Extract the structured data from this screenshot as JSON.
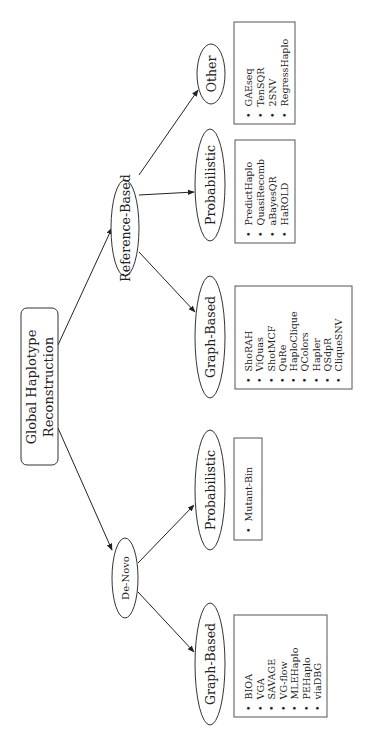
{
  "diagram": {
    "orientation": "rotated-90-ccw",
    "root": {
      "label_line1": "Global Haplotype",
      "label_line2": "Reconstruction"
    },
    "branches": [
      {
        "label": "Reference-Based",
        "children": [
          {
            "label": "Graph-Based",
            "items": [
              "ShoRAH",
              "ViQuas",
              "ShotMCF",
              "QuRe",
              "HaploClique",
              "QColors",
              "Hapler",
              "QSdpR",
              "CliqueSNV"
            ]
          },
          {
            "label": "Probabilistic",
            "items": [
              "PredictHaplo",
              "QuasiRecomb",
              "aBayesQR",
              "HaROLD"
            ]
          },
          {
            "label": "Other",
            "items": [
              "GAEseq",
              "TenSQR",
              "2SNV",
              "RegressHaplo"
            ]
          }
        ]
      },
      {
        "label": "De-Novo",
        "children": [
          {
            "label": "Graph-Based",
            "items": [
              "BIOA",
              "VGA",
              "SAVAGE",
              "VG-flow",
              "MLEHaplo",
              "PEHaplo",
              "viaDBG"
            ]
          },
          {
            "label": "Probabilistic",
            "items": [
              "Mutant-Bin"
            ]
          }
        ]
      }
    ],
    "bullet": "•",
    "colors": {
      "stroke": "#333333",
      "text": "#222222",
      "background": "#ffffff"
    }
  }
}
